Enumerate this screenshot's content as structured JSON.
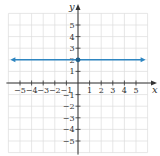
{
  "chart_data": {
    "type": "line",
    "title": "",
    "xlabel": "x",
    "ylabel": "y",
    "xlim": [
      -6,
      6
    ],
    "ylim": [
      -6,
      6
    ],
    "grid": true,
    "x_ticks": [
      -5,
      -4,
      -3,
      -2,
      -1,
      1,
      2,
      3,
      4,
      5
    ],
    "y_ticks": [
      -5,
      -4,
      -3,
      -2,
      -1,
      1,
      2,
      3,
      4,
      5
    ],
    "x_tick_labels": [
      "−5",
      "−4",
      "−3",
      "−2",
      "−1",
      "1",
      "2",
      "3",
      "4",
      "5"
    ],
    "y_tick_labels": [
      "−5",
      "−4",
      "−3",
      "−2",
      "−1",
      "1",
      "2",
      "3",
      "4",
      "5"
    ],
    "series": [
      {
        "name": "y = 2",
        "type": "horizontal-line",
        "equation": "y = 2",
        "x": [
          -6,
          6
        ],
        "y": [
          2,
          2
        ],
        "arrows": "both",
        "color": "#2e86c1"
      }
    ],
    "points": [
      {
        "x": 0,
        "y": 2,
        "label": "y-intercept",
        "color": "#1f5f8b"
      }
    ]
  },
  "colors": {
    "line": "#2e86c1",
    "point": "#1f5f8b",
    "axis": "#333333",
    "grid": "#dddddd"
  }
}
